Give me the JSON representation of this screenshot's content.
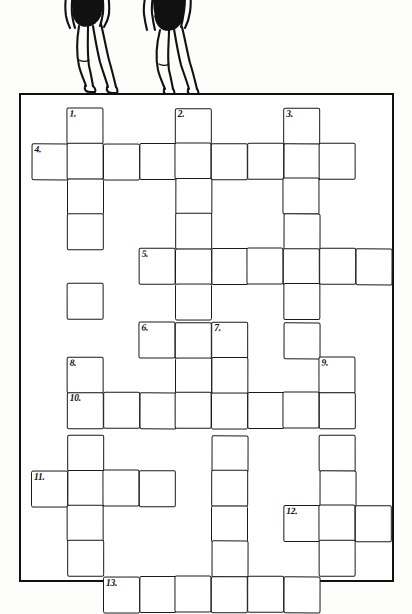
{
  "page": {
    "illustration": "two-divers-on-diving-board",
    "background_color": "#fdfdfc",
    "ink_color": "#1a1a1a"
  },
  "frame": {
    "x": 19,
    "y": 93,
    "width": 375,
    "height": 489,
    "border_color": "#111111",
    "border_width": 2.5
  },
  "grid": {
    "cell_size": 36,
    "origin_x": 31,
    "origin_y": 108,
    "columns": [
      31,
      67,
      103,
      139,
      175,
      211,
      247,
      283,
      319,
      355
    ],
    "rows": [
      108,
      143,
      178,
      213,
      248,
      283,
      322,
      357,
      392,
      435,
      470,
      505,
      540
    ],
    "entries": [
      {
        "number": "1.",
        "direction": "down",
        "col": 1,
        "row": 0,
        "length": 5
      },
      {
        "number": "2.",
        "direction": "down",
        "col": 4,
        "row": 0,
        "length": 7
      },
      {
        "number": "3.",
        "direction": "down",
        "col": 7,
        "row": 0,
        "length": 5
      },
      {
        "number": "4.",
        "direction": "across",
        "col": 0,
        "row": 1,
        "length": 10
      },
      {
        "number": "5.",
        "direction": "across",
        "col": 3,
        "row": 4,
        "length": 7
      },
      {
        "number": "6.",
        "direction": "across",
        "col": 3,
        "row": 6,
        "length": 3
      },
      {
        "number": "7.",
        "direction": "down",
        "col": 5,
        "row": 6,
        "length": 7
      },
      {
        "number": "8.",
        "direction": "down",
        "col": 1,
        "row": 8,
        "length": 5
      },
      {
        "number": "9.",
        "direction": "down",
        "col": 8,
        "row": 8,
        "length": 5
      },
      {
        "number": "10.",
        "direction": "across",
        "col": 1,
        "row": 9,
        "length": 8
      },
      {
        "number": "11.",
        "direction": "across",
        "col": 0,
        "row": 11,
        "length": 4
      },
      {
        "number": "12.",
        "direction": "across",
        "col": 7,
        "row": 12,
        "length": 3
      },
      {
        "number": "13.",
        "direction": "across",
        "col": 2,
        "row": 14,
        "length": 6
      }
    ],
    "cells": [
      {
        "c": 1,
        "r": 0,
        "n": "1."
      },
      {
        "c": 4,
        "r": 0,
        "n": "2."
      },
      {
        "c": 7,
        "r": 0,
        "n": "3."
      },
      {
        "c": 0,
        "r": 1,
        "n": "4."
      },
      {
        "c": 1,
        "r": 1,
        "n": ""
      },
      {
        "c": 2,
        "r": 1,
        "n": ""
      },
      {
        "c": 3,
        "r": 1,
        "n": ""
      },
      {
        "c": 4,
        "r": 1,
        "n": ""
      },
      {
        "c": 5,
        "r": 1,
        "n": ""
      },
      {
        "c": 6,
        "r": 1,
        "n": ""
      },
      {
        "c": 7,
        "r": 1,
        "n": ""
      },
      {
        "c": 8,
        "r": 1,
        "n": ""
      },
      {
        "c": 1,
        "r": 2,
        "n": ""
      },
      {
        "c": 4,
        "r": 2,
        "n": ""
      },
      {
        "c": 7,
        "r": 2,
        "n": ""
      },
      {
        "c": 1,
        "r": 3,
        "n": ""
      },
      {
        "c": 4,
        "r": 3,
        "n": ""
      },
      {
        "c": 7,
        "r": 3,
        "n": ""
      },
      {
        "c": 3,
        "r": 4,
        "n": "5."
      },
      {
        "c": 4,
        "r": 4,
        "n": ""
      },
      {
        "c": 5,
        "r": 4,
        "n": ""
      },
      {
        "c": 6,
        "r": 4,
        "n": ""
      },
      {
        "c": 7,
        "r": 4,
        "n": ""
      },
      {
        "c": 8,
        "r": 4,
        "n": ""
      },
      {
        "c": 9,
        "r": 4,
        "n": ""
      },
      {
        "c": 1,
        "r": 5,
        "n": ""
      },
      {
        "c": 4,
        "r": 5,
        "n": ""
      },
      {
        "c": 7,
        "r": 5,
        "n": ""
      },
      {
        "c": 3,
        "r": 6,
        "n": "6."
      },
      {
        "c": 4,
        "r": 6,
        "n": ""
      },
      {
        "c": 5,
        "r": 6,
        "n": "7."
      },
      {
        "c": 7,
        "r": 6,
        "n": ""
      },
      {
        "c": 1,
        "r": 7,
        "n": "8."
      },
      {
        "c": 4,
        "r": 7,
        "n": ""
      },
      {
        "c": 5,
        "r": 7,
        "n": ""
      },
      {
        "c": 8,
        "r": 7,
        "n": "9."
      },
      {
        "c": 1,
        "r": 8,
        "n": "10."
      },
      {
        "c": 2,
        "r": 8,
        "n": ""
      },
      {
        "c": 3,
        "r": 8,
        "n": ""
      },
      {
        "c": 4,
        "r": 8,
        "n": ""
      },
      {
        "c": 5,
        "r": 8,
        "n": ""
      },
      {
        "c": 6,
        "r": 8,
        "n": ""
      },
      {
        "c": 7,
        "r": 8,
        "n": ""
      },
      {
        "c": 8,
        "r": 8,
        "n": ""
      },
      {
        "c": 1,
        "r": 9,
        "n": ""
      },
      {
        "c": 5,
        "r": 9,
        "n": ""
      },
      {
        "c": 8,
        "r": 9,
        "n": ""
      },
      {
        "c": 0,
        "r": 10,
        "n": "11."
      },
      {
        "c": 1,
        "r": 10,
        "n": ""
      },
      {
        "c": 2,
        "r": 10,
        "n": ""
      },
      {
        "c": 3,
        "r": 10,
        "n": ""
      },
      {
        "c": 5,
        "r": 10,
        "n": ""
      },
      {
        "c": 8,
        "r": 10,
        "n": ""
      },
      {
        "c": 1,
        "r": 11,
        "n": ""
      },
      {
        "c": 5,
        "r": 11,
        "n": ""
      },
      {
        "c": 7,
        "r": 11,
        "n": "12."
      },
      {
        "c": 8,
        "r": 11,
        "n": ""
      },
      {
        "c": 9,
        "r": 11,
        "n": ""
      },
      {
        "c": 1,
        "r": 12,
        "n": ""
      },
      {
        "c": 5,
        "r": 12,
        "n": ""
      },
      {
        "c": 8,
        "r": 12,
        "n": ""
      },
      {
        "c": 2,
        "r": 13,
        "n": "13."
      },
      {
        "c": 3,
        "r": 13,
        "n": ""
      },
      {
        "c": 4,
        "r": 13,
        "n": ""
      },
      {
        "c": 5,
        "r": 13,
        "n": ""
      },
      {
        "c": 6,
        "r": 13,
        "n": ""
      },
      {
        "c": 7,
        "r": 13,
        "n": ""
      }
    ]
  }
}
